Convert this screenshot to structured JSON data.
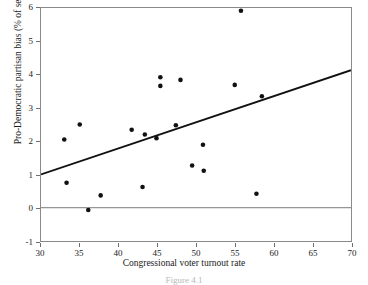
{
  "chart_data": {
    "type": "scatter",
    "title": "",
    "xlabel": "Congressional voter turnout rate",
    "ylabel": "Pro-Democratic partisan bias (% of seats)",
    "xlim": [
      30,
      70
    ],
    "ylim": [
      -1,
      6
    ],
    "xticks": [
      30,
      35,
      40,
      45,
      50,
      55,
      60,
      65,
      70
    ],
    "yticks": [
      -1,
      0,
      1,
      2,
      3,
      4,
      5,
      6
    ],
    "grid": false,
    "legend": null,
    "marker": {
      "shape": "circle",
      "color": "#111111",
      "size_px": 4.6
    },
    "zero_reference_line": {
      "y": 0,
      "color": "#7a7a7a",
      "width_px": 1
    },
    "trend_line": {
      "label": "fitted regression line",
      "color": "#111111",
      "width_px": 2,
      "x_start": 30,
      "y_start": 1.0,
      "x_end": 70,
      "y_end": 4.13,
      "slope": 0.0783,
      "intercept": -1.35
    },
    "points": [
      {
        "x": 33.0,
        "y": 2.05
      },
      {
        "x": 33.3,
        "y": 0.75
      },
      {
        "x": 35.0,
        "y": 2.5
      },
      {
        "x": 36.1,
        "y": -0.07
      },
      {
        "x": 37.7,
        "y": 0.37
      },
      {
        "x": 41.7,
        "y": 2.34
      },
      {
        "x": 43.1,
        "y": 0.62
      },
      {
        "x": 43.4,
        "y": 2.2
      },
      {
        "x": 44.9,
        "y": 2.09
      },
      {
        "x": 45.4,
        "y": 3.92
      },
      {
        "x": 45.4,
        "y": 3.66
      },
      {
        "x": 47.4,
        "y": 2.48
      },
      {
        "x": 48.0,
        "y": 3.84
      },
      {
        "x": 49.5,
        "y": 1.27
      },
      {
        "x": 50.9,
        "y": 1.89
      },
      {
        "x": 51.0,
        "y": 1.11
      },
      {
        "x": 55.0,
        "y": 3.69
      },
      {
        "x": 55.8,
        "y": 5.92
      },
      {
        "x": 57.8,
        "y": 0.42
      },
      {
        "x": 58.5,
        "y": 3.35
      }
    ]
  },
  "caption": "Figure 4.1"
}
